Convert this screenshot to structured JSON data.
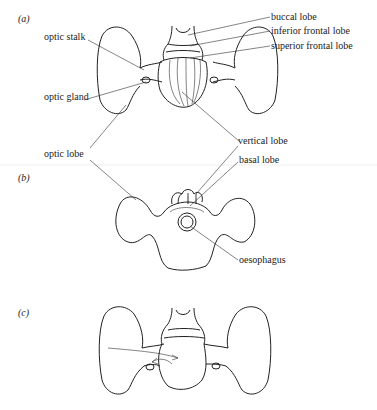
{
  "panels": [
    {
      "id": "a",
      "label": "(a)"
    },
    {
      "id": "b",
      "label": "(b)"
    },
    {
      "id": "c",
      "label": "(c)"
    }
  ],
  "labels": {
    "buccal_lobe": "buccal lobe",
    "inferior_frontal_lobe": "inferior frontal lobe",
    "superior_frontal_lobe": "superior frontal lobe",
    "optic_stalk": "optic stalk",
    "optic_gland": "optic gland",
    "optic_lobe": "optic lobe",
    "vertical_lobe": "vertical lobe",
    "basal_lobe": "basal lobe",
    "oesophagus": "oesophagus"
  },
  "colors": {
    "ink": "#222222",
    "background": "#ffffff"
  }
}
